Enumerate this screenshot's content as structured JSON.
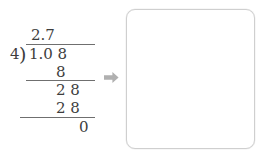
{
  "problem": {
    "type": "long-division",
    "divisor": "4",
    "bracket_glyph": ")",
    "dividend": "1.0 8",
    "quotient": "2.7",
    "steps": [
      {
        "label": "subtrahend-one",
        "value": "8"
      },
      {
        "label": "remainder-one",
        "value": "2 8"
      },
      {
        "label": "subtrahend-two",
        "value": "2 8"
      },
      {
        "label": "final-remainder",
        "value": "0"
      }
    ]
  },
  "arrow": {
    "icon": "arrow-right-icon",
    "color": "#b0b0b0"
  },
  "answer_box": {
    "content": "",
    "border_color": "#cfcfcf",
    "background": "#ffffff"
  },
  "colors": {
    "ink": "#3d3d3d",
    "rule": "#6f6f6f",
    "arrow": "#b0b0b0",
    "box_border": "#cfcfcf",
    "page_background": "#ffffff"
  }
}
